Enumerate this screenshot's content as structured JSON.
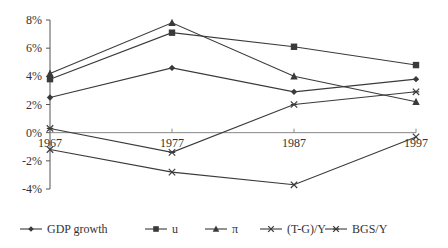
{
  "chart_data": {
    "type": "line",
    "title": "",
    "xlabel": "",
    "ylabel": "",
    "x": [
      "1967",
      "1977",
      "1987",
      "1997"
    ],
    "ylim": [
      -4,
      8
    ],
    "yticks": [
      8,
      6,
      4,
      2,
      0,
      -2,
      -4
    ],
    "ytick_labels": [
      "8%",
      "6%",
      "4%",
      "2%",
      "0%",
      "-2%",
      "-4%"
    ],
    "grid": false,
    "legend_position": "bottom",
    "series": [
      {
        "name": "GDP growth",
        "marker": "diamond",
        "values": [
          2.5,
          4.6,
          2.9,
          3.8
        ]
      },
      {
        "name": "u",
        "marker": "square",
        "values": [
          3.8,
          7.1,
          6.1,
          4.8
        ]
      },
      {
        "name": "π",
        "marker": "triangle",
        "values": [
          4.2,
          7.8,
          4.0,
          2.2
        ]
      },
      {
        "name": "(T-G)/Y",
        "marker": "x",
        "values": [
          -1.2,
          -2.8,
          -3.7,
          -0.3
        ]
      },
      {
        "name": "BGS/Y",
        "marker": "asterisk",
        "values": [
          0.3,
          -1.4,
          2.0,
          2.9
        ]
      }
    ]
  },
  "colors": {
    "line": "#3a3a3a",
    "axis": "#555555",
    "text": "#333333"
  }
}
